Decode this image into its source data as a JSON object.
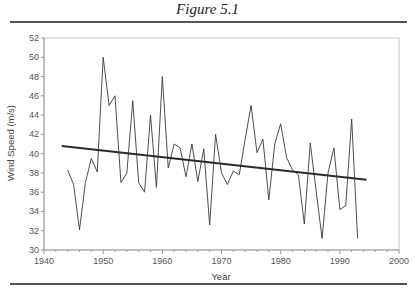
{
  "figure": {
    "title": "Figure 5.1"
  },
  "chart_data": {
    "type": "line",
    "title": "",
    "xlabel": "Year",
    "ylabel": "Wind Speed (m/s)",
    "xlim": [
      1940,
      2000
    ],
    "ylim": [
      30,
      52
    ],
    "x_ticks": [
      1940,
      1950,
      1960,
      1970,
      1980,
      1990,
      2000
    ],
    "y_ticks": [
      30,
      32,
      34,
      36,
      38,
      40,
      42,
      44,
      46,
      48,
      50,
      52
    ],
    "grid": false,
    "legend": null,
    "series": [
      {
        "name": "Annual wind speed",
        "x": [
          1944,
          1945,
          1946,
          1947,
          1948,
          1949,
          1950,
          1951,
          1952,
          1953,
          1954,
          1955,
          1956,
          1957,
          1958,
          1959,
          1960,
          1961,
          1962,
          1963,
          1964,
          1965,
          1966,
          1967,
          1968,
          1969,
          1970,
          1971,
          1972,
          1973,
          1974,
          1975,
          1976,
          1977,
          1978,
          1979,
          1980,
          1981,
          1982,
          1983,
          1984,
          1985,
          1986,
          1987,
          1988,
          1989,
          1990,
          1991,
          1992,
          1993
        ],
        "values": [
          38.3,
          36.8,
          32.1,
          37.0,
          39.5,
          38.1,
          50.0,
          45.0,
          46.0,
          37.0,
          38.0,
          45.5,
          37.0,
          36.0,
          44.0,
          36.5,
          48.0,
          38.5,
          41.0,
          40.6,
          37.6,
          41.0,
          37.1,
          40.5,
          32.6,
          42.0,
          38.0,
          36.8,
          38.2,
          37.8,
          41.5,
          45.0,
          40.1,
          41.5,
          35.2,
          41.0,
          43.1,
          39.6,
          38.3,
          37.8,
          32.7,
          41.1,
          36.1,
          31.2,
          38.0,
          40.6,
          34.2,
          34.6,
          43.6,
          31.2
        ]
      },
      {
        "name": "Linear trend",
        "x": [
          1943,
          1994.5
        ],
        "values": [
          40.8,
          37.3
        ]
      }
    ]
  }
}
